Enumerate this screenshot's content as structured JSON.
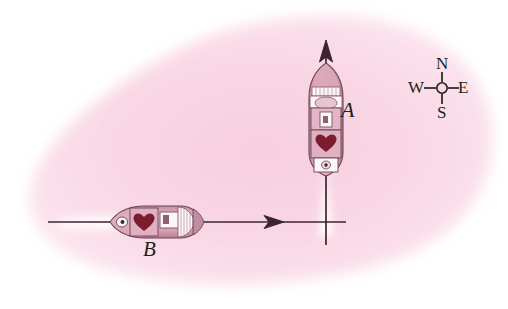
{
  "figure": {
    "type": "physics-vector-diagram",
    "background_color": "#f9d7e4",
    "canvas_color": "#ffffff",
    "line_color": "#3b2530"
  },
  "labels": {
    "ship_a": "A",
    "ship_b": "B"
  },
  "compass": {
    "north": "N",
    "south": "S",
    "east": "E",
    "west": "W",
    "center_x": 442,
    "center_y": 88
  },
  "ships": [
    {
      "name": "A",
      "heading": "north",
      "center_x": 326,
      "center_y": 118,
      "length": 110,
      "beam": 34,
      "hull_color": "#d8a3b6",
      "deck_color": "#efd2dc",
      "cargo_color": "#7d1c2e",
      "superstructure_color": "#fdf5f8"
    },
    {
      "name": "B",
      "heading": "west",
      "center_x": 152,
      "center_y": 222,
      "length": 90,
      "beam": 30,
      "hull_color": "#d8a3b6",
      "deck_color": "#efd2dc",
      "cargo_color": "#7d1c2e",
      "superstructure_color": "#fdf5f8"
    }
  ],
  "vectors": [
    {
      "name": "ship-a-velocity",
      "direction": "up",
      "from_x": 326,
      "from_y": 232,
      "to_x": 326,
      "to_y": 42,
      "arrowhead": true
    },
    {
      "name": "ship-b-velocity",
      "direction": "right",
      "from_x": 48,
      "from_y": 222,
      "to_x": 345,
      "to_y": 222,
      "arrowhead_x": 282,
      "arrowhead": true
    }
  ],
  "wakes": [
    {
      "name": "wake-a",
      "orientation": "vertical",
      "x": 326,
      "y_start": 160,
      "y_end": 232
    },
    {
      "name": "wake-b",
      "orientation": "horizontal",
      "y": 222,
      "x_start": 60,
      "x_end": 118
    }
  ]
}
